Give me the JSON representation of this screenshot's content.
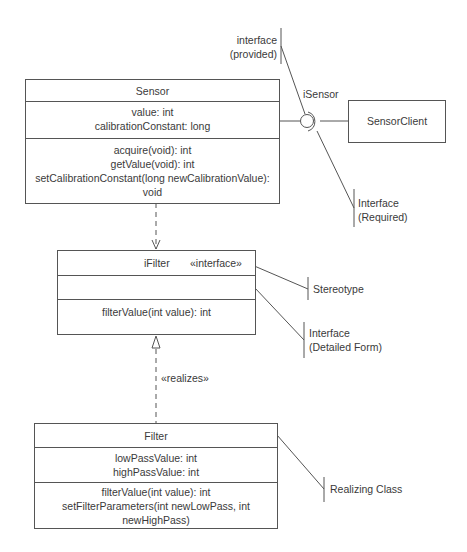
{
  "diagram": {
    "type": "UML class diagram (interfaces)",
    "classes": {
      "sensor": {
        "name": "Sensor",
        "attributes": [
          "value: int",
          "calibrationConstant: long"
        ],
        "operations": [
          "acquire(void): int",
          "getValue(void): int",
          "setCalibrationConstant(long newCalibrationValue):",
          "void"
        ]
      },
      "sensor_client": {
        "name": "SensorClient"
      },
      "ifilter": {
        "name": "iFilter",
        "stereotype": "«interface»",
        "attributes": [],
        "operations": [
          "filterValue(int value): int"
        ]
      },
      "filter": {
        "name": "Filter",
        "attributes": [
          "lowPassValue: int",
          "highPassValue: int"
        ],
        "operations": [
          "filterValue(int value): int",
          "setFilterParameters(int newLowPass, int",
          "newHighPass)"
        ]
      }
    },
    "interface_lollipop": {
      "name": "iSensor"
    },
    "relationships": {
      "dependency": {
        "from": "Sensor",
        "to": "iFilter",
        "style": "dashed open arrow"
      },
      "realization": {
        "from": "Filter",
        "to": "iFilter",
        "label": "«realizes»",
        "style": "dashed hollow triangle"
      }
    },
    "annotations": {
      "provided": [
        "interface",
        "(provided)"
      ],
      "required": [
        "Interface",
        "(Required)"
      ],
      "stereotype": [
        "Stereotype"
      ],
      "detailed_form": [
        "Interface",
        "(Detailed Form)"
      ],
      "realizing_class": [
        "Realizing Class"
      ]
    }
  }
}
